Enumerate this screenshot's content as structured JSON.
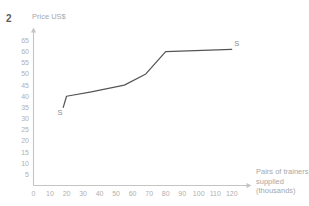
{
  "question": {
    "number": "2"
  },
  "chart_data": {
    "type": "line",
    "title": "",
    "ylabel": "Price US$",
    "xlabel": "Pairs of trainers supplied (thousands)",
    "xlabel_lines": [
      "Pairs of trainers",
      "supplied",
      "(thousands)"
    ],
    "xlim": [
      0,
      125
    ],
    "ylim": [
      0,
      67
    ],
    "ytick_labels": [
      "65",
      "60",
      "55",
      "50",
      "45",
      "40",
      "35",
      "30",
      "25",
      "20",
      "15",
      "10",
      "5"
    ],
    "ytick_values": [
      65,
      60,
      55,
      50,
      45,
      40,
      35,
      30,
      25,
      20,
      15,
      10,
      5
    ],
    "xtick_labels": [
      "0",
      "10",
      "20",
      "30",
      "40",
      "50",
      "60",
      "70",
      "80",
      "90",
      "100",
      "110",
      "120"
    ],
    "xtick_values": [
      0,
      10,
      20,
      30,
      40,
      50,
      60,
      70,
      80,
      90,
      100,
      110,
      120
    ],
    "grid": false,
    "legend": "none",
    "series": [
      {
        "name": "S",
        "label_start": "S",
        "label_end": "S",
        "color": "#555555",
        "x": [
          18,
          20,
          35,
          55,
          68,
          80,
          120
        ],
        "values": [
          35,
          40,
          42,
          45,
          50,
          60,
          61
        ]
      }
    ],
    "annotations": [
      {
        "text": "S",
        "x": 16,
        "y": 31.5
      },
      {
        "text": "S",
        "x": 123,
        "y": 62.5
      }
    ]
  },
  "colors": {
    "axis": "#c4c4c4",
    "tick_text": "#b0b0b0",
    "curve": "#555555",
    "title_text": "#a8a8a8",
    "question_number": "#5a5a5a",
    "background": "#ffffff"
  }
}
